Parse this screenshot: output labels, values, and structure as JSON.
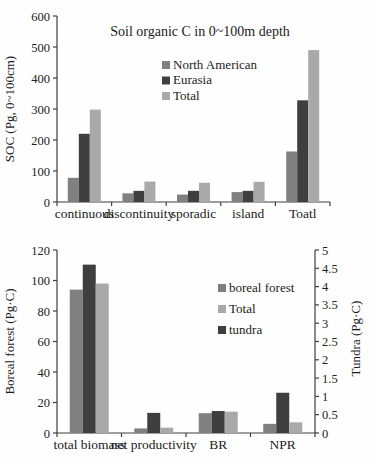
{
  "figure": {
    "background": "#fefefe",
    "axis_color": "#3f3f3f",
    "text_color": "#1c1c1c"
  },
  "chart_data": [
    {
      "type": "bar",
      "title": "Soil organic C in 0~100m depth",
      "ylabel": "SOC (Pg, 0~100cm)",
      "xlabel": "",
      "ylim": [
        0,
        600
      ],
      "yticks": [
        0,
        100,
        200,
        300,
        400,
        500,
        600
      ],
      "grid": false,
      "legend_position": "inside-upper-middle",
      "categories": [
        "continuous",
        "discontinuity",
        "sporadic",
        "island",
        "Toatl"
      ],
      "series": [
        {
          "name": "North American",
          "color": "#808080",
          "values": [
            78,
            28,
            24,
            32,
            163
          ]
        },
        {
          "name": "Eurasia",
          "color": "#3f3f3f",
          "values": [
            220,
            36,
            36,
            36,
            328
          ]
        },
        {
          "name": "Total",
          "color": "#a9a9a9",
          "values": [
            298,
            66,
            62,
            65,
            490
          ]
        }
      ],
      "legend": [
        "North American",
        "Eurasia",
        "Total"
      ]
    },
    {
      "type": "bar",
      "title": "",
      "ylabel_left": "Boreal forest (Pg·C)",
      "ylabel_right": "Tundra (Pg·C)",
      "ylim_left": [
        0,
        120
      ],
      "yticks_left": [
        0,
        20,
        40,
        60,
        80,
        100,
        120
      ],
      "ylim_right": [
        0,
        5
      ],
      "yticks_right": [
        0,
        0.5,
        1,
        1.5,
        2,
        2.5,
        3,
        3.5,
        4,
        4.5,
        5
      ],
      "grid": false,
      "legend_position": "inside-middle-right",
      "categories": [
        "total biomass",
        "net productivity",
        "BR",
        "NPR"
      ],
      "series": [
        {
          "name": "boreal forest",
          "axis": "left",
          "color": "#808080",
          "values": [
            94,
            3,
            13,
            6
          ]
        },
        {
          "name": "tundra",
          "axis": "right",
          "color": "#3f3f3f",
          "values": [
            4.6,
            0.55,
            0.6,
            1.1
          ]
        },
        {
          "name": "Total",
          "axis": "left",
          "color": "#a9a9a9",
          "values": [
            98,
            3.5,
            14,
            7
          ]
        }
      ],
      "legend": [
        "boreal forest",
        "Total",
        "tundra"
      ]
    }
  ]
}
